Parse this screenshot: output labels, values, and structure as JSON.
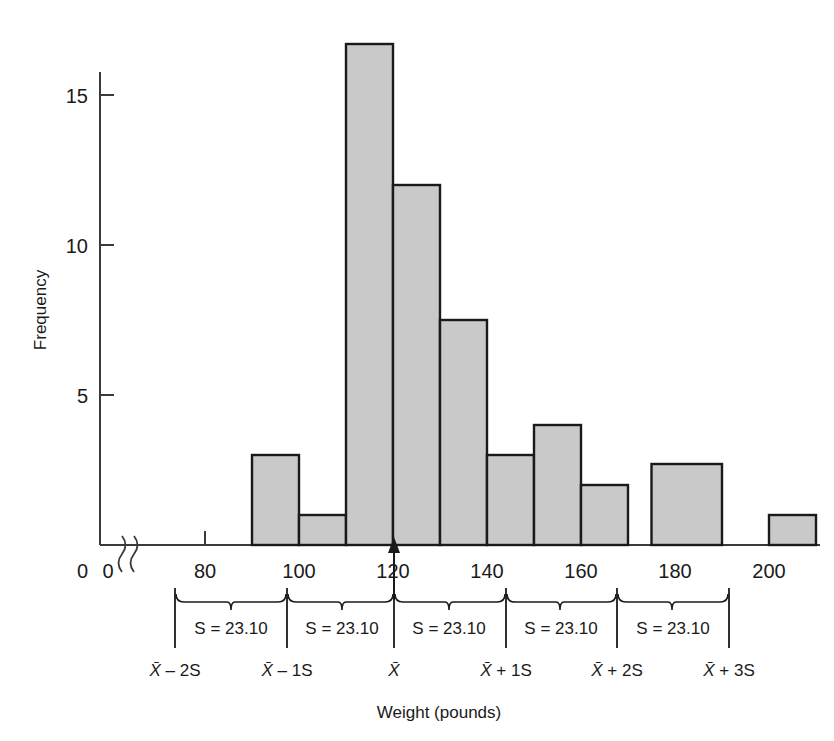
{
  "chart_data": {
    "type": "bar",
    "title": "",
    "subtitle": "",
    "xlabel": "Weight (pounds)",
    "ylabel": "Frequency",
    "xlim": [
      80,
      212
    ],
    "ylim": [
      0,
      17.5
    ],
    "grid": false,
    "legend": null,
    "axis_break": true,
    "x_tick_labels": [
      "0",
      "80",
      "100",
      "120",
      "140",
      "160",
      "180",
      "200"
    ],
    "x_tick_values": [
      0,
      80,
      100,
      120,
      140,
      160,
      180,
      200
    ],
    "y_tick_labels": [
      "0",
      "5",
      "10",
      "15"
    ],
    "y_tick_values": [
      0,
      5,
      10,
      15
    ],
    "bin_width": 10,
    "bin_edges": [
      90,
      100,
      110,
      120,
      130,
      140,
      150,
      160,
      170,
      180,
      190,
      200,
      210
    ],
    "categories": [
      "90-100",
      "100-110",
      "110-120",
      "120-130",
      "130-140",
      "140-150",
      "150-160",
      "160-170",
      "170-180",
      "180-190",
      "190-200",
      "200-210"
    ],
    "values": [
      3,
      1,
      16.7,
      12,
      7.5,
      3,
      4,
      2,
      0,
      2.7,
      0,
      1
    ],
    "bars": [
      {
        "x0": 90,
        "x1": 100,
        "height": 3
      },
      {
        "x0": 100,
        "x1": 110,
        "height": 1
      },
      {
        "x0": 110,
        "x1": 120,
        "height": 16.7
      },
      {
        "x0": 120,
        "x1": 130,
        "height": 12
      },
      {
        "x0": 130,
        "x1": 140,
        "height": 7.5
      },
      {
        "x0": 140,
        "x1": 150,
        "height": 3
      },
      {
        "x0": 150,
        "x1": 160,
        "height": 4
      },
      {
        "x0": 160,
        "x1": 170,
        "height": 2
      },
      {
        "x0": 175,
        "x1": 190,
        "height": 2.7
      },
      {
        "x0": 200,
        "x1": 210,
        "height": 1
      }
    ],
    "annotations": {
      "mean_marker": "arrow-up",
      "mean_x": 130,
      "sd_value": "23.10",
      "sd_label_text": "S = 23.10",
      "interval_labels": [
        "X̄ – 2S",
        "X̄ – 1S",
        "X̄",
        "X̄ + 1S",
        "X̄ + 2S",
        "X̄ + 3S"
      ],
      "interval_boundaries_x": [
        83.8,
        106.9,
        130.0,
        153.1,
        176.2,
        199.3
      ],
      "sd_band_labels": [
        "S = 23.10",
        "S = 23.10",
        "S = 23.10",
        "S = 23.10",
        "S = 23.10"
      ]
    },
    "colors": {
      "bar_fill": "#c9c9c9",
      "bar_stroke": "#1a1a1a",
      "axis": "#3a3a3a",
      "text": "#1a1a1a",
      "background": "#ffffff"
    }
  },
  "ylabel_text": "Frequency",
  "xlabel_text": "Weight (pounds)",
  "sd_bands": [
    {
      "label": "S = 23.10"
    },
    {
      "label": "S = 23.10"
    },
    {
      "label": "S = 23.10"
    },
    {
      "label": "S = 23.10"
    },
    {
      "label": "S = 23.10"
    }
  ],
  "interval_ticks": [
    {
      "label_x": "X̄",
      "label_op": " – 2S"
    },
    {
      "label_x": "X̄",
      "label_op": " – 1S"
    },
    {
      "label_x": "X̄",
      "label_op": ""
    },
    {
      "label_x": "X̄",
      "label_op": " + 1S"
    },
    {
      "label_x": "X̄",
      "label_op": " + 2S"
    },
    {
      "label_x": "X̄",
      "label_op": " + 3S"
    }
  ],
  "x_ticks": [
    {
      "label": "0"
    },
    {
      "label": "80"
    },
    {
      "label": "100"
    },
    {
      "label": "120"
    },
    {
      "label": "140"
    },
    {
      "label": "160"
    },
    {
      "label": "180"
    },
    {
      "label": "200"
    }
  ],
  "y_ticks": [
    {
      "label": "15"
    },
    {
      "label": "10"
    },
    {
      "label": "5"
    },
    {
      "label": "0"
    }
  ]
}
